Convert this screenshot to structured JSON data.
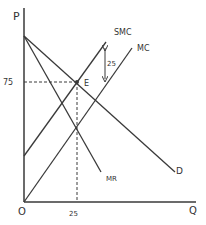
{
  "diagram": {
    "axes": {
      "y_label": "P",
      "x_label": "Q",
      "origin_label": "O"
    },
    "curves": {
      "smc": {
        "label": "SMC"
      },
      "mc": {
        "label": "MC"
      },
      "mr": {
        "label": "MR"
      },
      "d": {
        "label": "D"
      }
    },
    "equilibrium": {
      "point_label": "E",
      "price_label": "75",
      "quantity_label": "25"
    },
    "tax_gap": {
      "label": "25"
    },
    "colors": {
      "line": "#3a3a3a",
      "text": "#333333",
      "background": "#ffffff"
    }
  }
}
